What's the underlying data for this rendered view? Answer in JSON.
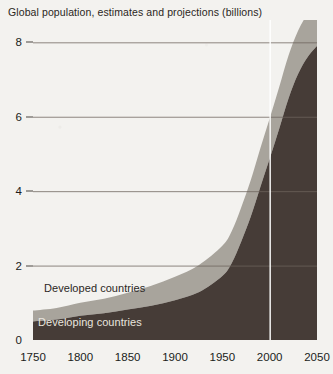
{
  "chart_data": {
    "type": "area",
    "title": "Global population, estimates and projections (billions)",
    "xlabel": "",
    "ylabel": "",
    "stacked": true,
    "grid": true,
    "legend_position": "inline-in-plot",
    "xlim": [
      1750,
      2050
    ],
    "ylim": [
      0,
      8.6
    ],
    "x_ticks": [
      1750,
      1800,
      1850,
      1900,
      1950,
      2000,
      2050
    ],
    "y_ticks": [
      0,
      2,
      4,
      6,
      8
    ],
    "annotations": [
      {
        "name": "projection-divider",
        "type": "vline",
        "x": 2000,
        "label": "",
        "color": "#ffffff"
      }
    ],
    "x": [
      1750,
      1775,
      1800,
      1825,
      1850,
      1875,
      1900,
      1925,
      1950,
      1960,
      1970,
      1980,
      1990,
      2000,
      2010,
      2020,
      2030,
      2040,
      2050
    ],
    "series": [
      {
        "name": "Developing countries",
        "color": "#463c37",
        "values": [
          0.5,
          0.55,
          0.65,
          0.72,
          0.82,
          0.92,
          1.07,
          1.28,
          1.72,
          2.07,
          2.65,
          3.31,
          4.1,
          4.87,
          5.67,
          6.5,
          7.15,
          7.6,
          7.9
        ]
      },
      {
        "name": "Developed countries",
        "color": "#a8a49c",
        "values": [
          0.29,
          0.31,
          0.35,
          0.39,
          0.45,
          0.54,
          0.63,
          0.73,
          0.81,
          0.86,
          0.92,
          0.98,
          1.04,
          1.08,
          1.12,
          1.15,
          1.16,
          1.16,
          1.15
        ]
      }
    ],
    "totals": [
      0.79,
      0.86,
      1.0,
      1.11,
      1.27,
      1.46,
      1.7,
      2.01,
      2.53,
      2.93,
      3.57,
      4.29,
      5.14,
      5.95,
      6.79,
      7.65,
      8.31,
      8.76,
      9.05
    ]
  },
  "axis": {
    "y_tick_labels": [
      "8",
      "6",
      "4",
      "2",
      "0"
    ],
    "x_tick_labels": [
      "1750",
      "1800",
      "1850",
      "1900",
      "1950",
      "2000",
      "2050"
    ]
  },
  "legend": {
    "developed_label": "Developed countries",
    "developing_label": "Developing countries"
  },
  "colors": {
    "developed": "#a8a49c",
    "developing": "#463c37",
    "grid": "#6e655d",
    "background": "#f3f2ef",
    "divider": "#ffffff"
  }
}
